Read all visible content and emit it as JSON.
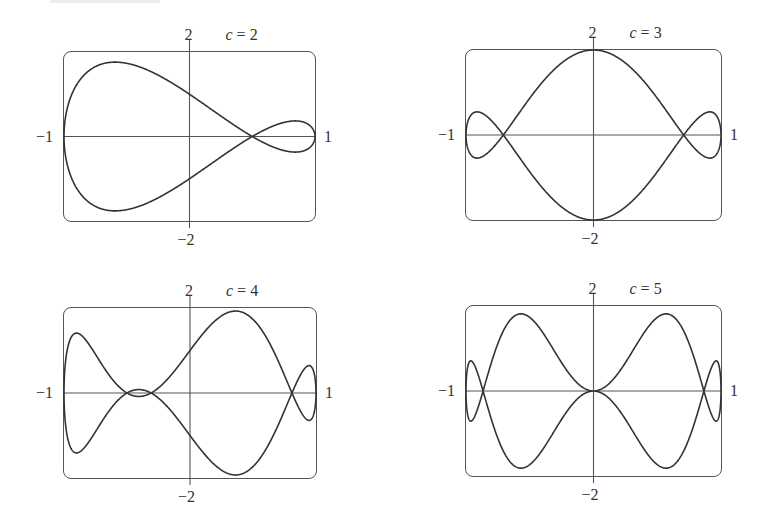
{
  "panels": [
    {
      "c_label": "c = 2",
      "c_var": "c",
      "c_eq": "= 2",
      "c": 2,
      "frame": {
        "x": 63,
        "y": 51,
        "w": 253,
        "h": 171
      },
      "labels": {
        "top": "2",
        "bottom": "−2",
        "left": "−1",
        "right": "1"
      }
    },
    {
      "c_label": "c = 3",
      "c_var": "c",
      "c_eq": "= 3",
      "c": 3,
      "frame": {
        "x": 465,
        "y": 49,
        "w": 257,
        "h": 172
      },
      "labels": {
        "top": "2",
        "bottom": "−2",
        "left": "−1",
        "right": "1"
      }
    },
    {
      "c_label": "c = 4",
      "c_var": "c",
      "c_eq": "= 4",
      "c": 4,
      "frame": {
        "x": 63,
        "y": 307,
        "w": 254,
        "h": 172
      },
      "labels": {
        "top": "2",
        "bottom": "−2",
        "left": "−1",
        "right": "1"
      }
    },
    {
      "c_label": "c = 5",
      "c_var": "c",
      "c_eq": "= 5",
      "c": 5,
      "frame": {
        "x": 465,
        "y": 305,
        "w": 257,
        "h": 172
      },
      "labels": {
        "top": "2",
        "bottom": "−2",
        "left": "−1",
        "right": "1"
      }
    }
  ],
  "style": {
    "curve_color": "#333333",
    "axis_color": "#555555",
    "frame_color": "#555555"
  },
  "chart_data": [
    {
      "type": "line",
      "title": "c = 2",
      "parametric": {
        "x": "cos t",
        "y": "sin t - sin(2t)",
        "t_range": [
          0,
          6.283
        ]
      },
      "xlabel": "",
      "ylabel": "",
      "xlim": [
        -1,
        1
      ],
      "ylim": [
        -2,
        2
      ],
      "tick_labels": {
        "x": [
          "−1",
          "1"
        ],
        "y": [
          "2",
          "−2"
        ]
      },
      "grid": false,
      "axes_through_origin": true
    },
    {
      "type": "line",
      "title": "c = 3",
      "parametric": {
        "x": "cos t",
        "y": "sin t - sin(3t)",
        "t_range": [
          0,
          6.283
        ]
      },
      "xlabel": "",
      "ylabel": "",
      "xlim": [
        -1,
        1
      ],
      "ylim": [
        -2,
        2
      ],
      "tick_labels": {
        "x": [
          "−1",
          "1"
        ],
        "y": [
          "2",
          "−2"
        ]
      },
      "grid": false,
      "axes_through_origin": true
    },
    {
      "type": "line",
      "title": "c = 4",
      "parametric": {
        "x": "cos t",
        "y": "sin t - sin(4t)",
        "t_range": [
          0,
          6.283
        ]
      },
      "xlabel": "",
      "ylabel": "",
      "xlim": [
        -1,
        1
      ],
      "ylim": [
        -2,
        2
      ],
      "tick_labels": {
        "x": [
          "−1",
          "1"
        ],
        "y": [
          "2",
          "−2"
        ]
      },
      "grid": false,
      "axes_through_origin": true
    },
    {
      "type": "line",
      "title": "c = 5",
      "parametric": {
        "x": "cos t",
        "y": "sin t - sin(5t)",
        "t_range": [
          0,
          6.283
        ]
      },
      "xlabel": "",
      "ylabel": "",
      "xlim": [
        -1,
        1
      ],
      "ylim": [
        -2,
        2
      ],
      "tick_labels": {
        "x": [
          "−1",
          "1"
        ],
        "y": [
          "2",
          "−2"
        ]
      },
      "grid": false,
      "axes_through_origin": true
    }
  ]
}
